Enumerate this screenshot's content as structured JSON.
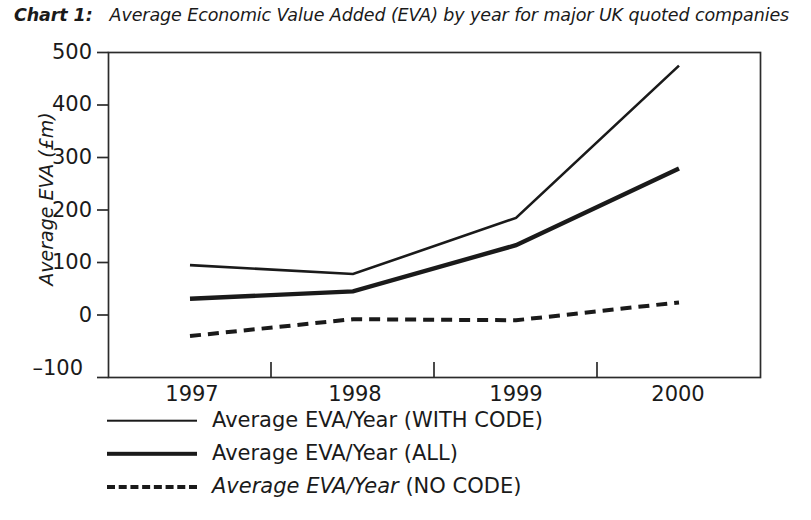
{
  "caption": {
    "label": "Chart 1:",
    "text": "Average Economic Value Added (EVA) by year for major UK quoted companies"
  },
  "chart_data": {
    "type": "line",
    "title": "Average Economic Value Added (EVA) by year for major UK quoted companies",
    "xlabel": "",
    "ylabel": "Average EVA (£m)",
    "categories": [
      "1997",
      "1998",
      "1999",
      "2000"
    ],
    "series": [
      {
        "name": "Average EVA/Year (WITH CODE)",
        "values": [
          95,
          78,
          185,
          475
        ],
        "style": "solid",
        "linewidth": 2.6,
        "color": "#1a1a1a"
      },
      {
        "name": "Average EVA/Year (ALL)",
        "values": [
          31,
          45,
          133,
          279
        ],
        "style": "solid",
        "linewidth": 4.4,
        "color": "#1a1a1a"
      },
      {
        "name": "Average EVA/Year (NO CODE)",
        "values": [
          -40,
          -8,
          -10,
          24
        ],
        "style": "dashed",
        "linewidth": 4.0,
        "color": "#1a1a1a"
      }
    ],
    "ylim": [
      -100,
      500
    ],
    "yticks": [
      500,
      400,
      300,
      200,
      100,
      0,
      -100
    ],
    "ytick_labels": [
      "500",
      "400",
      "300",
      "200",
      "100",
      "0",
      "–100"
    ],
    "grid": false,
    "legend_position": "below-left",
    "frame": "box"
  },
  "y_axis": {
    "title": "Average EVA (£m)",
    "ticks": [
      "500",
      "400",
      "300",
      "200",
      "100",
      "0",
      "–100"
    ]
  },
  "x_axis": {
    "ticks": [
      "1997",
      "1998",
      "1999",
      "2000"
    ]
  },
  "legend": {
    "items": [
      {
        "label": "Average EVA/Year (WITH CODE)",
        "italic_part": "",
        "plain_part": "Average EVA/Year (WITH CODE)",
        "swatch": "line-thin"
      },
      {
        "label": "Average EVA/Year (ALL)",
        "italic_part": "",
        "plain_part": "Average EVA/Year (ALL)",
        "swatch": "line-thick"
      },
      {
        "label": "Average EVA/Year (NO CODE)",
        "italic_part": "Average EVA/Year",
        "plain_part": " (NO CODE)",
        "swatch": "line-dashed"
      }
    ]
  }
}
